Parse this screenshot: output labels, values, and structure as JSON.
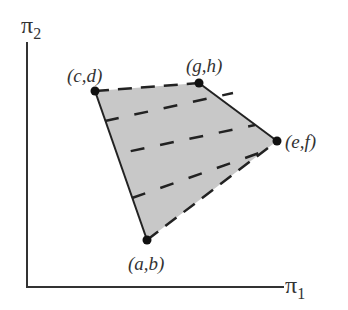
{
  "diagram": {
    "type": "payoff-region",
    "axes": {
      "x_label": "π",
      "x_sub": "1",
      "y_label": "π",
      "y_sub": "2"
    },
    "points": [
      {
        "id": "ab",
        "label": "(a,b)",
        "x": 147,
        "y": 240
      },
      {
        "id": "cd",
        "label": "(c,d)",
        "x": 95,
        "y": 91
      },
      {
        "id": "gh",
        "label": "(g,h)",
        "x": 199,
        "y": 83
      },
      {
        "id": "ef",
        "label": "(e,f)",
        "x": 277,
        "y": 141
      }
    ],
    "region": {
      "fill": "#c8c8c8",
      "solid_edges": [
        "cd-ab",
        "gh-ef"
      ],
      "dashed_edges": [
        "cd-gh",
        "ab-ef"
      ],
      "interior_dashed_lines": 3
    },
    "colors": {
      "stroke": "#222222",
      "fill": "#c8c8c8",
      "text": "#333333"
    }
  }
}
